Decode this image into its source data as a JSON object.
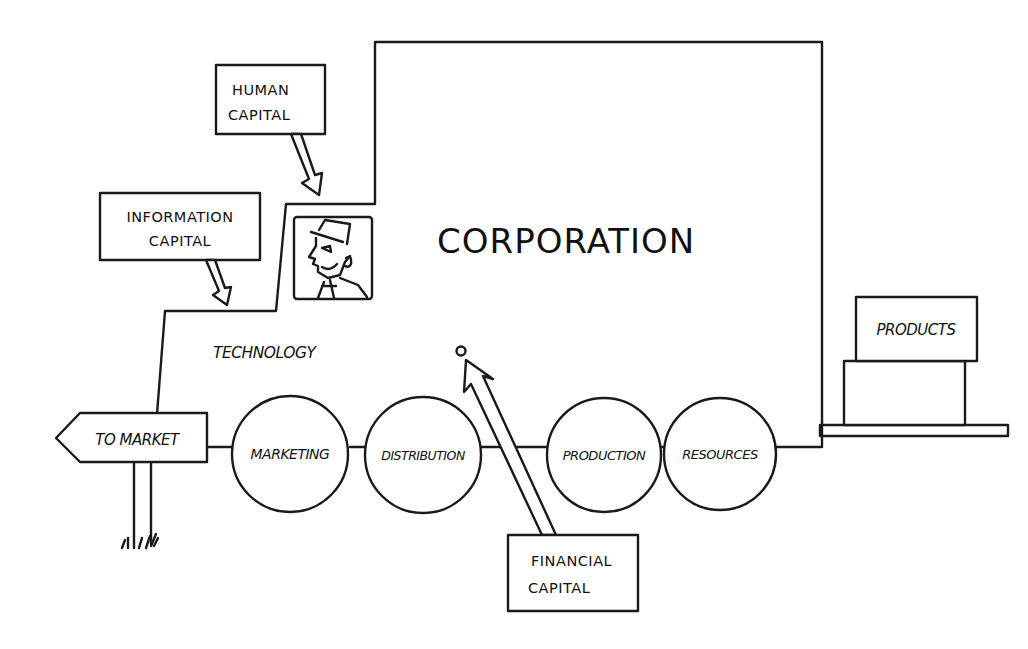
{
  "diagram": {
    "main_entity": {
      "label": "CORPORATION"
    },
    "inputs": [
      {
        "id": "human",
        "line1": "HUMAN",
        "line2": "CAPITAL"
      },
      {
        "id": "information",
        "line1": "INFORMATION",
        "line2": "CAPITAL"
      },
      {
        "id": "financial",
        "line1": "FINANCIAL",
        "line2": "CAPITAL"
      }
    ],
    "technology_label": "TECHNOLOGY",
    "process_chain": [
      {
        "label": "MARKETING"
      },
      {
        "label": "DISTRIBUTION"
      },
      {
        "label": "PRODUCTION"
      },
      {
        "label": "RESOURCES"
      }
    ],
    "signpost": {
      "label": "TO MARKET"
    },
    "output": {
      "label": "PRODUCTS"
    },
    "colors": {
      "line": "#1a1a1a",
      "background": "#ffffff"
    }
  }
}
